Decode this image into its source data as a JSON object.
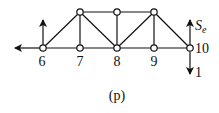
{
  "diagram": {
    "type": "truss",
    "caption": "(p)",
    "line_color": "#111111",
    "node_fill": "#ffffff",
    "nodes": [
      {
        "id": "6",
        "x": 43,
        "y": 48,
        "label": "6",
        "lx": 42,
        "ly": 66
      },
      {
        "id": "7",
        "x": 80,
        "y": 48,
        "label": "7",
        "lx": 80,
        "ly": 66
      },
      {
        "id": "8",
        "x": 117,
        "y": 48,
        "label": "8",
        "lx": 117,
        "ly": 66
      },
      {
        "id": "9",
        "x": 154,
        "y": 48,
        "label": "9",
        "lx": 154,
        "ly": 66
      },
      {
        "id": "10",
        "x": 190,
        "y": 48,
        "label": "10",
        "lx": 202,
        "ly": 53
      },
      {
        "id": "T1",
        "x": 80,
        "y": 12,
        "label": ""
      },
      {
        "id": "T2",
        "x": 117,
        "y": 12,
        "label": ""
      },
      {
        "id": "T3",
        "x": 154,
        "y": 12,
        "label": ""
      }
    ],
    "members": [
      [
        "6",
        "7"
      ],
      [
        "7",
        "8"
      ],
      [
        "8",
        "9"
      ],
      [
        "9",
        "10"
      ],
      [
        "T1",
        "T2"
      ],
      [
        "T2",
        "T3"
      ],
      [
        "6",
        "T1"
      ],
      [
        "T1",
        "7"
      ],
      [
        "T1",
        "8"
      ],
      [
        "T2",
        "8"
      ],
      [
        "8",
        "T3"
      ],
      [
        "T3",
        "9"
      ],
      [
        "T3",
        "10"
      ]
    ],
    "loads": [
      {
        "name": "left-horizontal-reaction",
        "from": [
          43,
          48
        ],
        "to": [
          15,
          48
        ]
      },
      {
        "name": "left-vertical-reaction",
        "from": [
          43,
          48
        ],
        "to": [
          43,
          20
        ]
      },
      {
        "name": "force-se",
        "from": [
          190,
          45
        ],
        "to": [
          190,
          20
        ],
        "label": "S",
        "subscript": "e",
        "lx": 195,
        "ly": 30
      },
      {
        "name": "unit-load",
        "from": [
          190,
          52
        ],
        "to": [
          190,
          74
        ],
        "label": "1",
        "lx": 195,
        "ly": 77
      }
    ]
  }
}
